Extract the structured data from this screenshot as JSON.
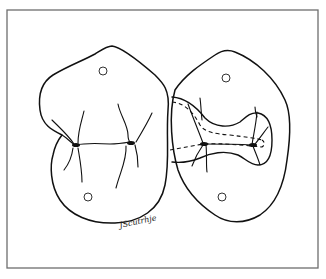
{
  "figure": {
    "type": "line-drawing",
    "frame_color": "#6e6e6e",
    "line_color": "#111111",
    "background": "#ffffff",
    "left_tooth": {
      "label": "intact molar occlusal surface",
      "markers": 2
    },
    "right_tooth": {
      "label": "molar with cavity preparation outline",
      "markers": 2,
      "outline_style": [
        "solid",
        "dashed"
      ]
    },
    "signature": "JScutrhje"
  }
}
